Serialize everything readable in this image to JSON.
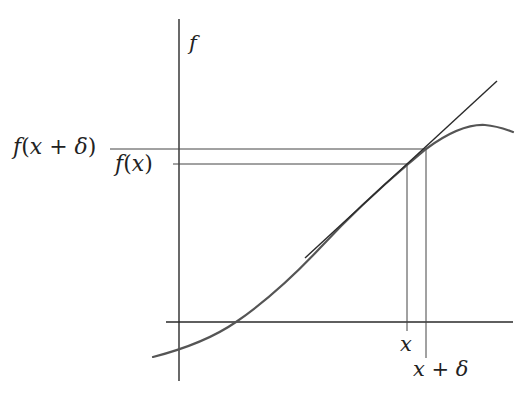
{
  "diagram": {
    "type": "function-tangent-approximation",
    "colors": {
      "axis": "#2a2a2a",
      "curve": "#555555",
      "tangent": "#2a2a2a",
      "guide": "#444444",
      "text": "#222222"
    },
    "labels": {
      "y_axis": "f",
      "f_x_plus_delta_fn": "f",
      "f_x_plus_delta_open": "(",
      "f_x_plus_delta_var": "x",
      "f_x_plus_delta_plus": " + ",
      "f_x_plus_delta_delta": "δ",
      "f_x_plus_delta_close": ")",
      "f_x_fn": "f",
      "f_x_open": "(",
      "f_x_var": "x",
      "f_x_close": ")",
      "x_tick": "x",
      "x_plus_delta_var": "x",
      "x_plus_delta_plus": " + ",
      "x_plus_delta_delta": "δ"
    },
    "elements": {
      "vertical_axis": {
        "x": 179,
        "y1": 19,
        "y2": 381
      },
      "horizontal_axis": {
        "y": 322,
        "x1": 166,
        "x2": 513
      },
      "tangent_point": {
        "x": 426,
        "y": 149
      },
      "guide_f_x_plus_delta": {
        "y": 149,
        "x1": 110,
        "x2": 426
      },
      "guide_f_x": {
        "y": 164,
        "x1": 173,
        "x2": 407
      },
      "guide_x": {
        "x": 407,
        "y1": 164,
        "y2": 331
      },
      "guide_x_plus_delta": {
        "x": 426,
        "y1": 149,
        "y2": 358
      },
      "tangent_line": {
        "x1": 305,
        "y1": 258,
        "x2": 497,
        "y2": 81
      }
    }
  }
}
